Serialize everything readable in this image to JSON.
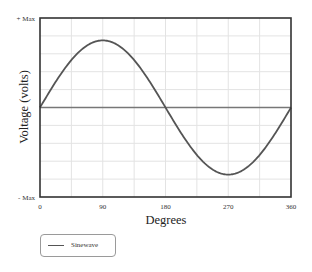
{
  "chart_data": {
    "type": "line",
    "title": "",
    "xlabel": "Degrees",
    "ylabel": "Voltage (volts)",
    "xlim": [
      0,
      360
    ],
    "ylim": [
      -1,
      1
    ],
    "x_ticks": [
      0,
      90,
      180,
      270,
      360
    ],
    "x_tick_labels": [
      "0",
      "90",
      "180",
      "270",
      "360"
    ],
    "y_tick_labels": {
      "top": "+ Max",
      "bottom": "- Max"
    },
    "grid": true,
    "grid_x_step": 45,
    "grid_y_divisions": 10,
    "legend_position": "below-left",
    "series": [
      {
        "name": "Sinewave",
        "color": "#555555",
        "function": "0.75*sin(x)",
        "x": [
          0,
          45,
          90,
          135,
          180,
          225,
          270,
          315,
          360
        ],
        "values": [
          0,
          0.53,
          0.75,
          0.53,
          0,
          -0.53,
          -0.75,
          -0.53,
          0
        ]
      }
    ],
    "reference_lines": [
      {
        "type": "horizontal",
        "y": 0,
        "color": "#777777"
      }
    ]
  },
  "labels": {
    "y_max": "+ Max",
    "y_min": "- Max",
    "x_title": "Degrees",
    "y_title": "Voltage (volts)",
    "legend_item": "Sinewave"
  },
  "colors": {
    "frame": "#333333",
    "grid": "#e3e3e3",
    "curve": "#555555",
    "zero_line": "#777777"
  }
}
